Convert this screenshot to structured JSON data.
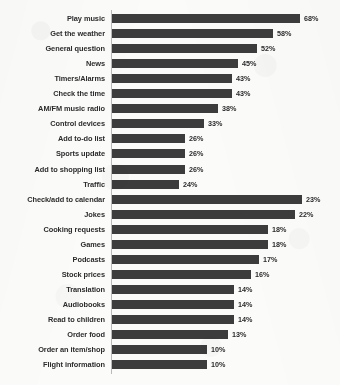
{
  "chart_data": {
    "type": "bar",
    "orientation": "horizontal",
    "title": "",
    "subtitle": "",
    "xlabel": "",
    "ylabel": "",
    "grid": false,
    "legend": false,
    "legend_position": "none",
    "value_suffix": "%",
    "note": "Category axis runs top-to-bottom in descending order of value. The drawn bar lengths use two different horizontal scales: the first 12 rows (68%-24%) are drawn at a compressed scale, and the last 12 rows (23%-10%) are drawn at an expanded scale, so a 23% bar appears about as long as a 68% bar.",
    "categories": [
      "Play music",
      "Get the weather",
      "General question",
      "News",
      "Timers/Alarms",
      "Check the time",
      "AM/FM music radio",
      "Control devices",
      "Add to-do list",
      "Sports update",
      "Add to shopping list",
      "Traffic",
      "Check/add to calendar",
      "Jokes",
      "Cooking requests",
      "Games",
      "Podcasts",
      "Stock prices",
      "Translation",
      "Audiobooks",
      "Read to children",
      "Order food",
      "Order an item/shop",
      "Flight information"
    ],
    "values": [
      68,
      58,
      52,
      45,
      43,
      43,
      38,
      33,
      26,
      26,
      26,
      24,
      23,
      22,
      18,
      18,
      17,
      16,
      14,
      14,
      14,
      13,
      10,
      10
    ],
    "value_labels": [
      "68%",
      "58%",
      "52%",
      "45%",
      "43%",
      "43%",
      "38%",
      "33%",
      "26%",
      "26%",
      "26%",
      "24%",
      "23%",
      "22%",
      "18%",
      "18%",
      "17%",
      "16%",
      "14%",
      "14%",
      "14%",
      "13%",
      "10%",
      "10%"
    ],
    "bar_pixel_widths": [
      188,
      161,
      145,
      126,
      120,
      120,
      106,
      92,
      73,
      73,
      73,
      67,
      190,
      183,
      156,
      156,
      147,
      139,
      122,
      122,
      122,
      116,
      95,
      95
    ],
    "xlim": [
      0,
      70
    ],
    "colors": {
      "bar": "#3c3c3c",
      "label_text": "#2c2c2c",
      "value_text": "#2b2b2b",
      "background": "#fbfbfa",
      "axis_line": "#b9b9b9"
    }
  }
}
